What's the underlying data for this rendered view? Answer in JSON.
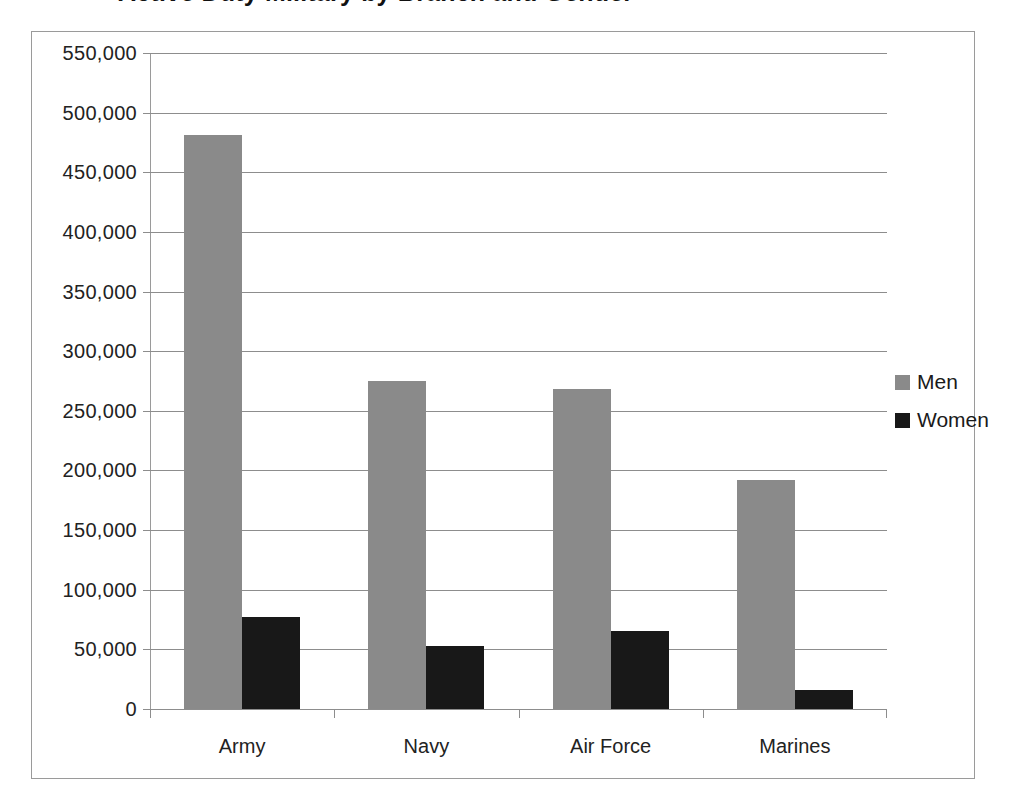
{
  "title_fragment": "Active Duty Military by Branch and Gender",
  "chart_data": {
    "type": "bar",
    "title": "",
    "xlabel": "",
    "ylabel": "",
    "categories": [
      "Army",
      "Navy",
      "Air Force",
      "Marines"
    ],
    "series": [
      {
        "name": "Men",
        "color": "#8a8a8a",
        "values": [
          481000,
          275000,
          268000,
          192000
        ]
      },
      {
        "name": "Women",
        "color": "#181818",
        "values": [
          77000,
          53000,
          65000,
          16000
        ]
      }
    ],
    "ylim": [
      0,
      550000
    ],
    "ytick_step": 50000,
    "yticks": [
      {
        "value": 550000,
        "label": "550,000"
      },
      {
        "value": 500000,
        "label": "500,000"
      },
      {
        "value": 450000,
        "label": "450,000"
      },
      {
        "value": 400000,
        "label": "400,000"
      },
      {
        "value": 350000,
        "label": "350,000"
      },
      {
        "value": 300000,
        "label": "300,000"
      },
      {
        "value": 250000,
        "label": "250,000"
      },
      {
        "value": 200000,
        "label": "200,000"
      },
      {
        "value": 150000,
        "label": "150,000"
      },
      {
        "value": 100000,
        "label": "100,000"
      },
      {
        "value": 50000,
        "label": "50,000"
      },
      {
        "value": 0,
        "label": "0"
      }
    ],
    "grid": true,
    "legend": {
      "position": "right",
      "entries": [
        {
          "label": "Men",
          "color": "#8a8a8a"
        },
        {
          "label": "Women",
          "color": "#181818"
        }
      ]
    }
  }
}
